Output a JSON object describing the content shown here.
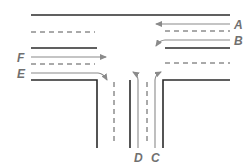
{
  "diagram": {
    "type": "T-intersection traffic flow",
    "colors": {
      "road": "#2b2b2b",
      "lane": "#555555",
      "arrow": "#8a8a8a",
      "label": "#707070"
    },
    "labels": {
      "A": "A",
      "B": "B",
      "C": "C",
      "D": "D",
      "E": "E",
      "F": "F"
    },
    "flows": [
      {
        "id": "A",
        "description": "right-to-left through movement on upper lane"
      },
      {
        "id": "B",
        "description": "right-to-left movement turning toward lower lane"
      },
      {
        "id": "C",
        "description": "from side road, turning right"
      },
      {
        "id": "D",
        "description": "from side road, turning left"
      },
      {
        "id": "E",
        "description": "left-to-right turning into side road"
      },
      {
        "id": "F",
        "description": "left-to-right through movement"
      }
    ]
  }
}
